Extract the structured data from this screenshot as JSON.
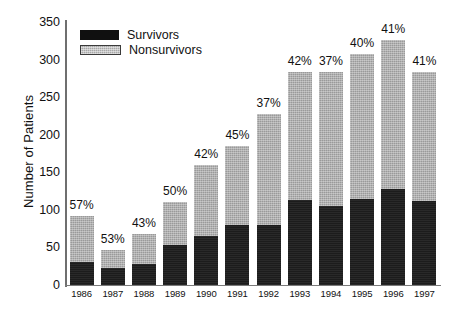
{
  "chart_data": {
    "type": "bar",
    "title": "",
    "xlabel": "",
    "ylabel": "Number of Patients",
    "ylim": [
      0,
      350
    ],
    "yticks": [
      0,
      50,
      100,
      150,
      200,
      250,
      300,
      350
    ],
    "grid": false,
    "stacked": true,
    "legend_position": "top-left",
    "categories": [
      "1986",
      "1987",
      "1988",
      "1989",
      "1990",
      "1991",
      "1992",
      "1993",
      "1994",
      "1995",
      "1996",
      "1997"
    ],
    "series": [
      {
        "name": "Survivors",
        "color": "#1c1c1c",
        "values": [
          31,
          23,
          28,
          53,
          65,
          80,
          80,
          113,
          105,
          115,
          128,
          112
        ]
      },
      {
        "name": "Nonsurvivors",
        "color": "#9a9a9a",
        "values": [
          61,
          24,
          40,
          58,
          95,
          105,
          148,
          170,
          178,
          193,
          198,
          171
        ]
      }
    ],
    "totals": [
      92,
      47,
      68,
      111,
      160,
      185,
      228,
      283,
      283,
      308,
      326,
      283
    ],
    "annotations": {
      "label": "mortality percentage above each bar",
      "values": [
        "57%",
        "53%",
        "43%",
        "50%",
        "42%",
        "45%",
        "37%",
        "42%",
        "37%",
        "40%",
        "41%",
        "41%"
      ]
    }
  },
  "legend": {
    "items": [
      {
        "label": "Survivors",
        "swatch": "black-filled-rect"
      },
      {
        "label": "Nonsurvivors",
        "swatch": "gray-stippled-rect"
      }
    ]
  },
  "axes": {
    "y_title": "Number of Patients"
  }
}
